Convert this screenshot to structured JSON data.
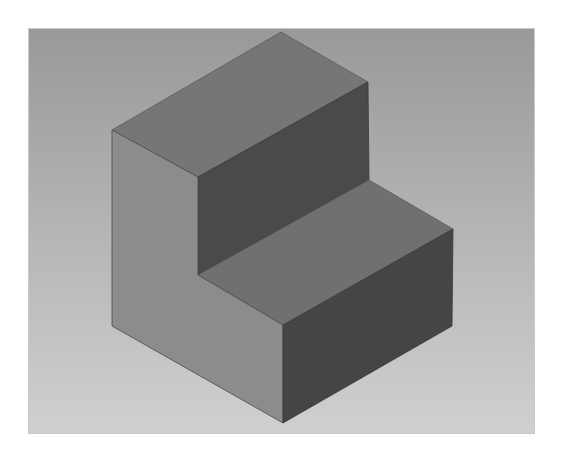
{
  "scene": {
    "object": "L-shaped step block (isometric view)",
    "background_gradient": {
      "top": "#999999",
      "bottom": "#d0d0d0"
    },
    "faces": {
      "upper_top": {
        "color": "#767676",
        "points": "112,130 281,32 368,82 198,177"
      },
      "riser_dark": {
        "color": "#4a4a4a",
        "points": "198,177 368,82 369,180 198,275"
      },
      "tread_top": {
        "color": "#707070",
        "points": "198,275 369,180 453,229 283,325"
      },
      "left_side": {
        "color": "#8c8c8c",
        "points": "112,130 198,177 198,275 283,325 283,423 112,326"
      },
      "front_dark": {
        "color": "#454545",
        "points": "283,325 453,229 452,326 283,423"
      }
    },
    "edge_color": "#3a3a3a"
  }
}
